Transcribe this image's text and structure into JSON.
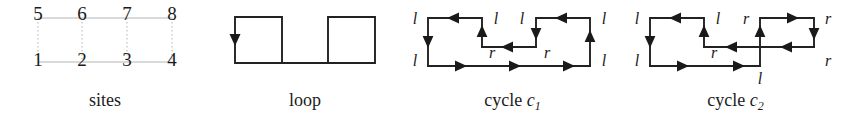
{
  "figure": {
    "background_color": "#ffffff",
    "ink_color": "#1a1a1a",
    "grid_color": "#b9b9b9",
    "panels": [
      {
        "id": "sites",
        "caption": "sites",
        "caption_italic_part": "",
        "caption_subscript": "",
        "site_labels": [
          "1",
          "2",
          "3",
          "4",
          "5",
          "6",
          "7",
          "8"
        ],
        "bottom_row_labels": [
          "1",
          "2",
          "3",
          "4"
        ],
        "top_row_labels": [
          "5",
          "6",
          "7",
          "8"
        ],
        "columns": 4,
        "rows": 2
      },
      {
        "id": "loop",
        "caption": "loop",
        "caption_italic_part": "",
        "caption_subscript": "",
        "description": "crenellated closed loop with one downward arrow on the left edge",
        "arrow_count": 1,
        "arrow_directions": [
          "down"
        ]
      },
      {
        "id": "cycle-c1",
        "caption_prefix": "cycle ",
        "caption_italic_part": "c",
        "caption_subscript": "1",
        "caption": "cycle c1",
        "edge_labels": {
          "outer_top_left": "l",
          "inner_top_left": "l",
          "inner_top_right": "l",
          "outer_top_right": "l",
          "outer_bottom_left": "l",
          "inner_left": "r",
          "inner_right": "r",
          "outer_bottom_right": "l"
        },
        "label_sequence": [
          "l",
          "l",
          "l",
          "l",
          "l",
          "r",
          "r",
          "l"
        ],
        "arrow_directions": [
          "left",
          "down",
          "right",
          "up",
          "left",
          "down",
          "left",
          "right",
          "right",
          "up"
        ]
      },
      {
        "id": "cycle-c2",
        "caption_prefix": "cycle ",
        "caption_italic_part": "c",
        "caption_subscript": "2",
        "caption": "cycle c2",
        "edge_labels": {
          "outer_top_left": "l",
          "inner_top_left": "l",
          "inner_top_right": "r",
          "outer_top_right": "r",
          "outer_bottom_left": "l",
          "inner_left": "r",
          "outer_bottom_right": "r",
          "bottom_center": "l"
        },
        "label_sequence": [
          "l",
          "l",
          "r",
          "r",
          "l",
          "r",
          "r",
          "l"
        ],
        "arrow_directions": [
          "left",
          "down",
          "right",
          "up",
          "right",
          "down",
          "left",
          "up",
          "left",
          "right"
        ]
      }
    ]
  }
}
